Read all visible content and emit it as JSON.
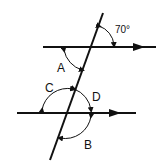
{
  "diagram": {
    "given_angle": "70°",
    "labels": {
      "a": "A",
      "b": "B",
      "c": "C",
      "d": "D"
    },
    "colors": {
      "stroke": "#111111",
      "background": "#ffffff"
    }
  }
}
